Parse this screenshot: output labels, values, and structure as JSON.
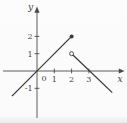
{
  "chart_data": {
    "type": "line",
    "xlabel": "x",
    "ylabel": "y",
    "origin_label": "0",
    "xlim": [
      -1.9,
      5.1
    ],
    "ylim": [
      -2.9,
      3.7
    ],
    "grid": false,
    "legend": "none",
    "x_ticks": [
      {
        "value": 1,
        "label": "1"
      },
      {
        "value": 2,
        "label": "2"
      },
      {
        "value": 3,
        "label": "3"
      }
    ],
    "y_ticks": [
      {
        "value": 2,
        "label": "2"
      },
      {
        "value": 1,
        "label": "1"
      },
      {
        "value": -1,
        "label": "-1"
      }
    ],
    "series": [
      {
        "name": "left-segment",
        "points": [
          [
            -1.45,
            -1.45
          ],
          [
            2,
            2
          ]
        ],
        "endpoints": [
          {
            "x": 2,
            "y": 2,
            "marker": "closed-dot"
          }
        ]
      },
      {
        "name": "right-segment",
        "points": [
          [
            2,
            1
          ],
          [
            4.35,
            -1.25
          ]
        ],
        "endpoints": [
          {
            "x": 2,
            "y": 1,
            "marker": "open-circle"
          }
        ]
      }
    ],
    "colors": {
      "axis": "#4a4a4a",
      "curve": "#3b3b3b",
      "label": "#444444",
      "background": "#fbfbfb"
    }
  }
}
